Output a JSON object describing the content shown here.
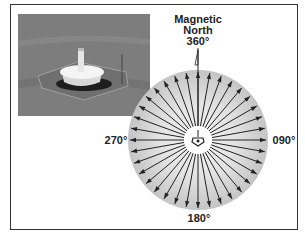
{
  "figure": {
    "title_lines": [
      "Magnetic",
      "North",
      "360°"
    ],
    "labels": {
      "north": "360°",
      "east": "090°",
      "south": "180°",
      "west": "270°"
    },
    "photo": {
      "description": "VOR station aerial photo"
    },
    "compass": {
      "radial_count": 36,
      "colors": {
        "disc_outer": "#c8c8c8",
        "disc_inner": "#f2f2f2",
        "arrow": "#222222",
        "frame": "#333333"
      }
    }
  }
}
